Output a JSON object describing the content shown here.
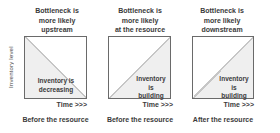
{
  "diagram": {
    "y_axis_label": "Inventory level",
    "panels": [
      {
        "title": "Bottleneck is\nmore likely\nupstream",
        "inner_label": "Inventory is\ndecreasing",
        "time_label": "Time >>>",
        "caption": "Before the resource",
        "shaded_region": "lower-left-triangle"
      },
      {
        "title": "Bottleneck is\nmore likely\nat the resource",
        "inner_label": "Inventory is\nbuilding",
        "time_label": "Time >>>",
        "caption": "Before the resource",
        "shaded_region": "lower-right-triangle"
      },
      {
        "title": "Bottleneck is\nmore likely\ndownstream",
        "inner_label": "Inventory is\nbuilding",
        "time_label": "Time >>>",
        "caption": "After the resource",
        "shaded_region": "lower-right-triangle"
      }
    ]
  },
  "colors": {
    "border": "#6a6a6a",
    "fill": "#efefef",
    "diagonal": "#c6c6c6",
    "text": "#3b3b3b"
  }
}
